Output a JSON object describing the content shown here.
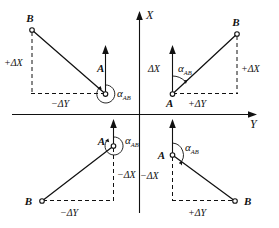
{
  "figure": {
    "axes": {
      "vertical_label": "X",
      "horizontal_label": "Y",
      "vertical_direction": "up",
      "horizontal_direction": "right"
    },
    "colors": {
      "ink": "#111111",
      "background": "#ffffff"
    },
    "quadrants": [
      {
        "id": "top-left",
        "name": "quadrant-II",
        "station_label": "A",
        "target_label": "B",
        "angle_label": "α",
        "angle_subscript": "AB",
        "dx_label": "+ΔX",
        "dy_label": "−ΔY",
        "arc_type": "reflex"
      },
      {
        "id": "top-right",
        "name": "quadrant-I",
        "station_label": "A",
        "target_label": "B",
        "angle_label": "α",
        "angle_subscript": "AB",
        "dx_label": "ΔX",
        "dx_label_outer": "+ΔX",
        "dy_label": "+ΔY",
        "arc_type": "acute"
      },
      {
        "id": "bottom-left",
        "name": "quadrant-III",
        "station_label": "A",
        "target_label": "B",
        "angle_label": "α",
        "angle_subscript": "AB",
        "dx_label": "−ΔX",
        "dy_label": "−ΔY",
        "arc_type": "reflex"
      },
      {
        "id": "bottom-right",
        "name": "quadrant-IV",
        "station_label": "A",
        "target_label": "B",
        "angle_label": "α",
        "angle_subscript": "AB",
        "dx_label": "−ΔX",
        "dy_label": "+ΔY",
        "arc_type": "obtuse"
      }
    ]
  }
}
